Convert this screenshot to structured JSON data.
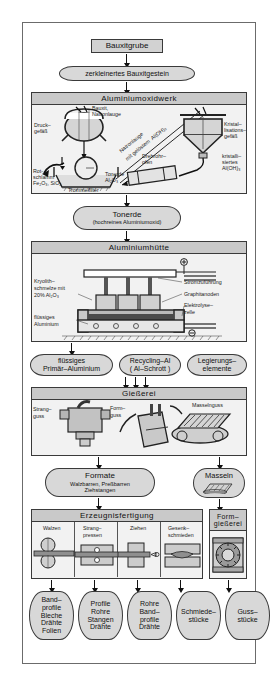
{
  "diagram": {
    "colors": {
      "node_fill": "#d2d2d2",
      "panel_fill": "#f2f2f2",
      "band_fill": "#c9c9c9",
      "stroke": "#3a3a3a"
    }
  },
  "nodes": {
    "bauxitgrube": "Bauxitgrube",
    "zerkleinert": "zerkleinertes Bauxitgestein",
    "tonerde_title": "Tonerde",
    "tonerde_sub": "(hochreines Aluminiumoxid)",
    "fluessiges_primar_1": "flüssiges",
    "fluessiges_primar_2": "Primär–Aluminium",
    "recycling_1": "Recycling–Al",
    "recycling_2": "( Al–Schrott )",
    "legierungs_1": "Legierungs–",
    "legierungs_2": "elemente",
    "formate_title": "Formate",
    "formate_sub1": "Walzbarren, Preßbarren",
    "formate_sub2": "Ziehstangen",
    "masseln": "Masseln"
  },
  "sections": {
    "oxidwerk": "Aluminiumoxidwerk",
    "huette": "Aluminiumhütte",
    "giesserei": "Gießerei",
    "erzeugnis": "Erzeugnisfertigung",
    "formgiesserei_1": "Form–",
    "formgiesserei_2": "gießerei"
  },
  "oxidwerk_labels": {
    "bauxit_natronlauge_1": "Bauxit,",
    "bauxit_natronlauge_2": "Natronlauge",
    "druckgefass_1": "Druck–",
    "druckgefass_2": "gefäß",
    "rotschlamm_1": "Rot-",
    "rotschlamm_2": "schlamm",
    "rotschlamm_3": "Fe₂O₃, SiO₂",
    "trommelfilter": "Trommelfilter",
    "natronlauge_diag_1": "Natronlauge",
    "natronlauge_diag_2": "mit gelöstem  Al(OH)₃",
    "kristallisation_1": "Kristal–",
    "kristallisation_2": "lisations–",
    "kristallisation_3": "gefäß",
    "kristallisiertes_1": "kristalli–",
    "kristallisiertes_2": "siertes",
    "kristallisiertes_3": "Al(OH)₃",
    "drehrohrofen_1": "Drehrohr–",
    "drehrohrofen_2": "ofen",
    "tonerde_small_1": "Tonerde",
    "tonerde_small_2": "Al₂O₃"
  },
  "huette_labels": {
    "kryolith_1": "Kryolith–",
    "kryolith_2": "schmelze mit",
    "kryolith_3": "20% Al₂O₃",
    "fluessiges_alu_1": "flüssiges",
    "fluessiges_alu_2": "Aluminium",
    "stromzufuehrung": "Stromzuführung",
    "graphitanoden": "Graphitanoden",
    "elektrolysezelle_1": "Elektrolyse–",
    "elektrolysezelle_2": "zelle",
    "plus": "+",
    "minus": "–"
  },
  "giesserei_labels": {
    "strangguss_1": "Strang–",
    "strangguss_2": "guss",
    "formguss_1": "Form–",
    "formguss_2": "guss",
    "masselnguss": "Masselnguss"
  },
  "erzeugnis_cells": [
    {
      "name": "Walzen"
    },
    {
      "name": "Strang–",
      "name2": "pressen"
    },
    {
      "name": "Ziehen"
    },
    {
      "name": "Gesenk–",
      "name2": "schmieden"
    }
  ],
  "products": [
    {
      "lines": [
        "Band–",
        "profile",
        "Bleche",
        "Drähte",
        "Folien"
      ]
    },
    {
      "lines": [
        "Profile",
        "Rohre",
        "Stangen",
        "Drähte"
      ]
    },
    {
      "lines": [
        "Rohre",
        "Band–",
        "profile",
        "Drähte"
      ]
    },
    {
      "lines": [
        "Schmiede–",
        "stücke"
      ]
    },
    {
      "lines": [
        "Guss–",
        "stücke"
      ]
    }
  ]
}
